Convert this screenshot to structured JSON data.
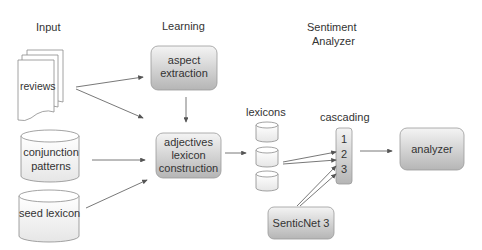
{
  "columns": {
    "input": "Input",
    "learning": "Learning",
    "sentiment_line1": "Sentiment",
    "sentiment_line2": "Analyzer"
  },
  "nodes": {
    "reviews": "reviews",
    "conjunction_line1": "conjunction",
    "conjunction_line2": "patterns",
    "seed_lexicon": "seed lexicon",
    "aspect_line1": "aspect",
    "aspect_line2": "extraction",
    "adj_line1": "adjectives",
    "adj_line2": "lexicon",
    "adj_line3": "construction",
    "lexicons": "lexicons",
    "cascading": "cascading",
    "cascade_items": [
      "1",
      "2",
      "3"
    ],
    "senticnet": "SenticNet 3",
    "analyzer": "analyzer"
  },
  "colors": {
    "box_top": "#f2f2f2",
    "box_bottom": "#b8b8b8",
    "stroke": "#8c8c8c",
    "arrow": "#555555",
    "text": "#333333"
  }
}
